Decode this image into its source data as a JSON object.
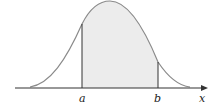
{
  "figure": {
    "labels": {
      "a": "a",
      "b": "b",
      "x_axis": "x"
    },
    "colors": {
      "curve": "#8a8a8a",
      "shade": "#ececec",
      "axis": "#333333",
      "bounds": "#333333"
    }
  }
}
